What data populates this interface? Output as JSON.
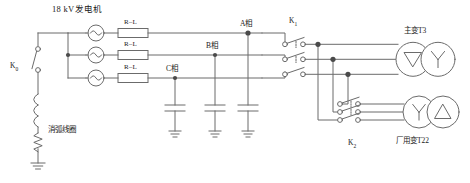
{
  "diagram": {
    "title": "18 kV发电机",
    "line_color": "#6b6b6b",
    "text_color": "#1a1a1a",
    "background": "#ffffff",
    "generators": [
      {
        "name": "generator-phase-a",
        "symbol": "sine-source-icon",
        "series_element": "R–L"
      },
      {
        "name": "generator-phase-b",
        "symbol": "sine-source-icon",
        "series_element": "R–L"
      },
      {
        "name": "generator-phase-c",
        "symbol": "sine-source-icon",
        "series_element": "R–L"
      }
    ],
    "rl_labels": [
      "R–L",
      "R–L",
      "R–L"
    ],
    "phase_labels": [
      "A相",
      "B相",
      "C相"
    ],
    "switches": {
      "k0": "K",
      "k0_sub": "0",
      "k1": "K",
      "k1_sub": "1",
      "k2": "K",
      "k2_sub": "2"
    },
    "arc_coil_label": "消弧线圈",
    "transformers": [
      {
        "label": "主变T3",
        "name": "main-transformer-t3",
        "winding_left": "delta-winding-icon",
        "winding_right": "wye-winding-icon"
      },
      {
        "label": "厂用变T22",
        "name": "station-service-transformer-t22",
        "winding_left": "wye-winding-icon",
        "winding_right": "delta-winding-icon"
      }
    ],
    "capacitors": [
      {
        "name": "capacitor-phase-c"
      },
      {
        "name": "capacitor-phase-b"
      },
      {
        "name": "capacitor-phase-a"
      }
    ],
    "grounds": 4
  }
}
